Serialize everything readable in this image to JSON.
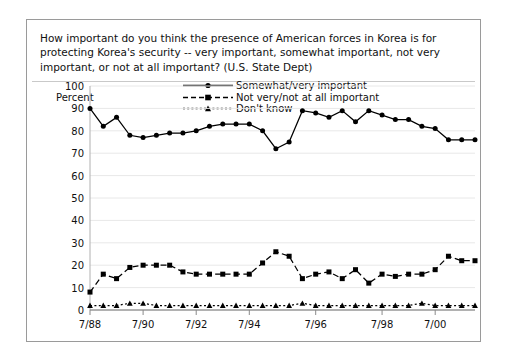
{
  "title": "How important do you think the presence of American forces in Korea is for protecting Korea's security -- very important, somewhat important, not very important, or not at all important? (U.S. State Dept)",
  "y_axis_label": "Percent",
  "legend": {
    "somewhat_very": "Somewhat/very important",
    "not_very": "Not very/not at all important",
    "dont_know": "Don't know"
  },
  "chart_data": {
    "type": "line",
    "title": "How important do you think the presence of American forces in Korea is for protecting Korea's security -- very important, somewhat important, not very important, or not at all important? (U.S. State Dept)",
    "xlabel": "",
    "ylabel": "Percent",
    "ylim": [
      0,
      100
    ],
    "ytick_values": [
      0,
      10,
      20,
      30,
      40,
      50,
      60,
      70,
      80,
      90,
      100
    ],
    "grid": "horizontal",
    "legend_position": "top-center",
    "xtick_labels": [
      "7/88",
      "7/90",
      "7/92",
      "7/94",
      "7/96",
      "7/98",
      "7/00"
    ],
    "xtick_indices": [
      0,
      4,
      8,
      12,
      17,
      22,
      26
    ],
    "x": [
      "7/88",
      "1/89",
      "7/89",
      "1/90",
      "7/90",
      "1/91",
      "7/91",
      "1/92",
      "7/92",
      "1/93",
      "7/93",
      "1/94",
      "7/94",
      "1/95",
      "7/95",
      "1/96",
      "4/96",
      "7/96",
      "1/97",
      "7/97",
      "1/98",
      "4/98",
      "7/98",
      "10/98",
      "1/99",
      "7/99",
      "7/00",
      "1/01",
      "7/01",
      "1/02"
    ],
    "series": [
      {
        "name": "Somewhat/very important",
        "marker": "circle",
        "linestyle": "solid",
        "values": [
          90,
          82,
          86,
          78,
          77,
          78,
          79,
          79,
          80,
          82,
          83,
          83,
          83,
          80,
          72,
          75,
          89,
          88,
          86,
          89,
          84,
          89,
          87,
          85,
          85,
          82,
          81,
          76,
          76,
          76
        ]
      },
      {
        "name": "Not very/not at all important",
        "marker": "square",
        "linestyle": "dashed",
        "values": [
          8,
          16,
          14,
          19,
          20,
          20,
          20,
          17,
          16,
          16,
          16,
          16,
          16,
          21,
          26,
          24,
          14,
          16,
          17,
          14,
          18,
          12,
          16,
          15,
          16,
          16,
          18,
          24,
          22,
          22
        ]
      },
      {
        "name": "Don't know",
        "marker": "triangle",
        "linestyle": "dotted",
        "values": [
          2,
          2,
          2,
          3,
          3,
          2,
          2,
          2,
          2,
          2,
          2,
          2,
          2,
          2,
          2,
          2,
          3,
          2,
          2,
          2,
          2,
          2,
          2,
          2,
          2,
          3,
          2,
          2,
          2,
          2
        ]
      }
    ]
  }
}
